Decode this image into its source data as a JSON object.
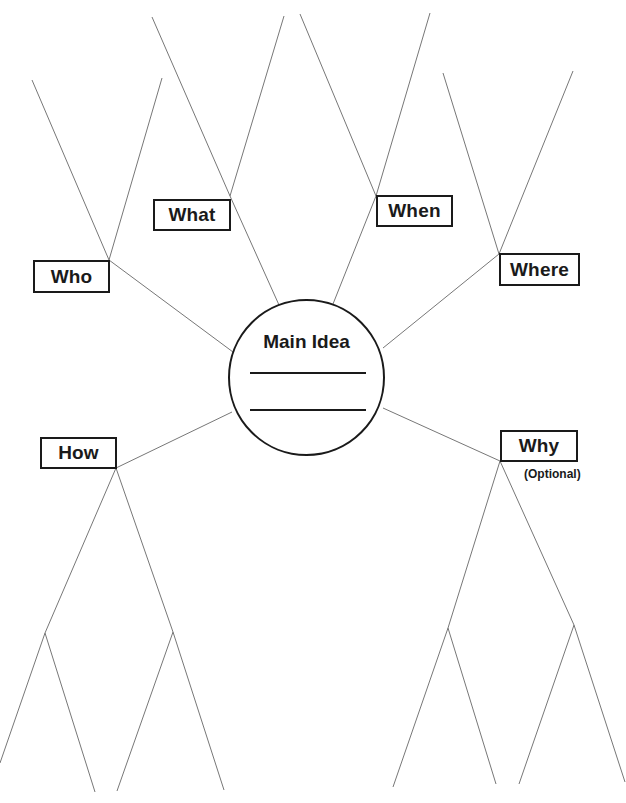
{
  "diagram": {
    "type": "5W1H graphic organizer (spider map)",
    "center": {
      "label": "Main Idea",
      "answer_lines": 2
    },
    "branches": [
      {
        "id": "who",
        "label": "Who"
      },
      {
        "id": "what",
        "label": "What"
      },
      {
        "id": "when",
        "label": "When"
      },
      {
        "id": "where",
        "label": "Where"
      },
      {
        "id": "how",
        "label": "How"
      },
      {
        "id": "why",
        "label": "Why",
        "note": "(Optional)"
      }
    ],
    "colors": {
      "ink": "#1a1a1a",
      "line": "#777777",
      "background": "#ffffff"
    }
  }
}
